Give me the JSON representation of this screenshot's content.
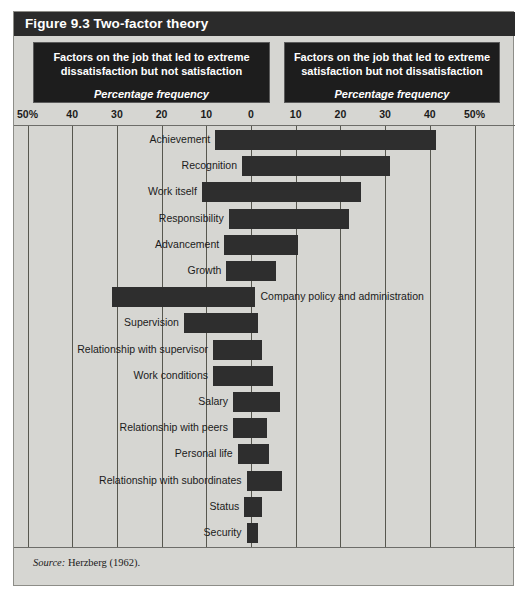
{
  "figure": {
    "title": "Figure 9.3 Two-factor theory",
    "source_keyword": "Source:",
    "source_text": "Herzberg (1962)."
  },
  "panels": {
    "left": {
      "title_line1": "Factors on the job that led to extreme",
      "title_line2": "dissatisfaction but not satisfaction",
      "subtitle": "Percentage frequency"
    },
    "right": {
      "title_line1": "Factors on the job that led to extreme",
      "title_line2": "satisfaction but not dissatisfaction",
      "subtitle": "Percentage frequency"
    }
  },
  "axis": {
    "tick_labels": [
      "50%",
      "40",
      "30",
      "20",
      "10",
      "0",
      "10",
      "20",
      "30",
      "40",
      "50%"
    ],
    "tick_values": [
      -50,
      -40,
      -30,
      -20,
      -10,
      0,
      10,
      20,
      30,
      40,
      50
    ]
  },
  "colors": {
    "frame_background": "#d6d6d2",
    "title_bar": "#2b2b2b",
    "panel_background": "#1d1d1d",
    "bar_fill": "#2e2e2e",
    "gridline": "#57574f",
    "text": "#1b1b1b"
  },
  "chart_data": {
    "type": "bar",
    "title": "Figure 9.3 Two-factor theory",
    "subtitle": "Percentage frequency",
    "orientation": "horizontal-diverging",
    "xlabel": "Percentage frequency",
    "ylabel": "",
    "xlim": [
      -50,
      50
    ],
    "grid": true,
    "legend_position": "top",
    "xticks": [
      -50,
      -40,
      -30,
      -20,
      -10,
      0,
      10,
      20,
      30,
      40,
      50
    ],
    "xtick_labels": [
      "50%",
      "40",
      "30",
      "20",
      "10",
      "0",
      "10",
      "20",
      "30",
      "40",
      "50%"
    ],
    "categories": [
      "Achievement",
      "Recognition",
      "Work itself",
      "Responsibility",
      "Advancement",
      "Growth",
      "Company policy and administration",
      "Supervision",
      "Relationship with supervisor",
      "Work conditions",
      "Salary",
      "Relationship with peers",
      "Personal life",
      "Relationship with subordinates",
      "Status",
      "Security"
    ],
    "series": [
      {
        "name": "Factors on the job that led to extreme dissatisfaction but not satisfaction",
        "side": "left",
        "values": [
          8,
          2,
          11,
          5,
          6,
          5.5,
          31,
          15,
          8.5,
          8.5,
          4,
          4,
          3,
          1,
          1.5,
          1
        ]
      },
      {
        "name": "Factors on the job that led to extreme satisfaction but not dissatisfaction",
        "side": "right",
        "values": [
          41.5,
          31,
          24.5,
          22,
          10.5,
          5.5,
          1,
          1.5,
          2.5,
          5,
          6.5,
          3.5,
          4,
          7,
          2.5,
          1.5
        ]
      }
    ],
    "label_placement": [
      "left",
      "left",
      "left",
      "left",
      "left",
      "left",
      "right",
      "left",
      "left",
      "left",
      "left",
      "left",
      "left",
      "left",
      "left",
      "left"
    ]
  }
}
